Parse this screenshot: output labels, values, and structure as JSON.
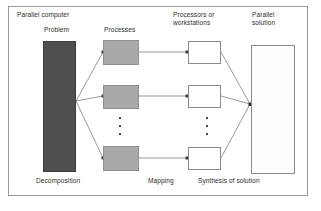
{
  "figure": {
    "frame_label": "Parallel computer"
  },
  "labels": {
    "parallel_computer": "Parallel computer",
    "problem": "Problem",
    "processes": "Processes",
    "processors": "Processors or\nworkstations",
    "parallel_solution": "Parallel\nsolution",
    "decomposition": "Decomposition",
    "mapping": "Mapping",
    "synthesis": "Synthesis of solution"
  },
  "colors": {
    "problem_fill": "#4f4f4f",
    "process_fill": "#a9a9a9",
    "processor_fill": "#ffffff",
    "solution_fill": "#fdfdfd",
    "frame_border": "#9a9a9a",
    "wire": "#6e6e6e",
    "text": "#2b2b2b"
  },
  "nodes": {
    "problem": {
      "name": "Problem"
    },
    "processes": [
      {
        "name": "process-1"
      },
      {
        "name": "process-2"
      },
      {
        "name": "process-n"
      }
    ],
    "processors": [
      {
        "name": "processor-1"
      },
      {
        "name": "processor-2"
      },
      {
        "name": "processor-n"
      }
    ],
    "solution": {
      "name": "Parallel solution"
    }
  },
  "ellipsis": {
    "processes_dots": "⋮",
    "processors_dots": "⋮"
  }
}
